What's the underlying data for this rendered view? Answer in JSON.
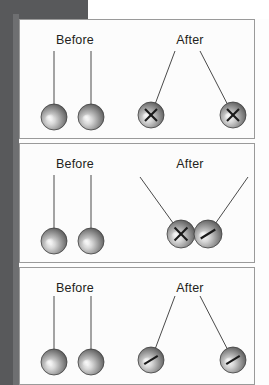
{
  "figure": {
    "title_visible": false,
    "panel_count": 3,
    "colors": {
      "page_backdrop": "#58595b",
      "sheet": "#fdfdfd",
      "panel_border": "#9a9a9a",
      "string": "#4a4a4a",
      "label_text": "#231f20",
      "ball_light": "#f2f2f2",
      "ball_mid": "#9d9d9d",
      "ball_dark": "#4f4f4f",
      "mark": "#1a1a1a"
    }
  },
  "panels": [
    {
      "id": "panel-collision-1",
      "name": "both-balls-recoil",
      "before": {
        "label": "Before",
        "label_x": 55,
        "label_y": 24,
        "balls": [
          {
            "cx": 34,
            "cy": 97,
            "r": 13,
            "pivot_x": 34,
            "pivot_y": 31,
            "mark": "none"
          },
          {
            "cx": 71,
            "cy": 97,
            "r": 13,
            "pivot_x": 71,
            "pivot_y": 31,
            "mark": "none"
          }
        ]
      },
      "after": {
        "label": "After",
        "label_x": 170,
        "label_y": 24,
        "balls": [
          {
            "cx": 131,
            "cy": 95,
            "r": 13,
            "pivot_x": 155,
            "pivot_y": 31,
            "mark": "x"
          },
          {
            "cx": 213,
            "cy": 95,
            "r": 13,
            "pivot_x": 180,
            "pivot_y": 31,
            "mark": "x"
          }
        ]
      }
    },
    {
      "id": "panel-collision-2",
      "name": "both-balls-together",
      "before": {
        "label": "Before",
        "label_x": 55,
        "label_y": 24,
        "balls": [
          {
            "cx": 34,
            "cy": 97,
            "r": 13,
            "pivot_x": 34,
            "pivot_y": 31,
            "mark": "none"
          },
          {
            "cx": 71,
            "cy": 97,
            "r": 13,
            "pivot_x": 71,
            "pivot_y": 31,
            "mark": "none"
          }
        ]
      },
      "after": {
        "label": "After",
        "label_x": 170,
        "label_y": 24,
        "balls": [
          {
            "cx": 161,
            "cy": 90,
            "r": 14,
            "pivot_x": 120,
            "pivot_y": 33,
            "mark": "x"
          },
          {
            "cx": 188,
            "cy": 90,
            "r": 14,
            "pivot_x": 228,
            "pivot_y": 33,
            "mark": "slash"
          }
        ]
      }
    },
    {
      "id": "panel-collision-3",
      "name": "both-balls-swing-apart",
      "before": {
        "label": "Before",
        "label_x": 55,
        "label_y": 24,
        "balls": [
          {
            "cx": 34,
            "cy": 94,
            "r": 13,
            "pivot_x": 34,
            "pivot_y": 28,
            "mark": "none"
          },
          {
            "cx": 71,
            "cy": 94,
            "r": 13,
            "pivot_x": 71,
            "pivot_y": 28,
            "mark": "none"
          }
        ]
      },
      "after": {
        "label": "After",
        "label_x": 170,
        "label_y": 24,
        "balls": [
          {
            "cx": 131,
            "cy": 92,
            "r": 13,
            "pivot_x": 155,
            "pivot_y": 28,
            "mark": "slash"
          },
          {
            "cx": 213,
            "cy": 92,
            "r": 13,
            "pivot_x": 180,
            "pivot_y": 28,
            "mark": "slash"
          }
        ]
      }
    }
  ],
  "labels": {
    "before": "Before",
    "after": "After"
  }
}
